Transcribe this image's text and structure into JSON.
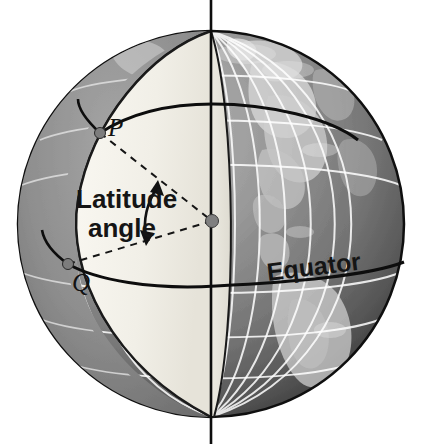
{
  "figure": {
    "labels": {
      "latitude_line1": "Latitude",
      "latitude_line2": "angle",
      "point_p": "P",
      "point_q": "Q",
      "equator": "Equator"
    },
    "colors": {
      "globe_light": "#a9a9a9",
      "globe_mid": "#8c8c8c",
      "globe_dark": "#4f4f4f",
      "cut_face": "#f2f0e9",
      "cut_face_shadow": "#e3e1d8",
      "outline": "#101010",
      "graticule": "#ffffff",
      "center_dot": "#808080",
      "label_text": "#151515"
    },
    "geometry": {
      "sphere_center_x": 211,
      "sphere_center_y": 224,
      "sphere_radius": 193,
      "axis_top_y": 0,
      "axis_bottom_y": 444,
      "point_p_x": 100,
      "point_p_y": 133,
      "point_q_x": 68,
      "point_q_y": 264,
      "center_dot_x": 212,
      "center_dot_y": 221,
      "center_dot_r": 6
    },
    "annotations": {
      "p_dot": "vertex-point-p",
      "q_dot": "vertex-point-q",
      "center_dot": "earth-center-point",
      "angle_arc": "double-headed-angle-arrow",
      "radius_p": "dashed-radius-to-p",
      "radius_q": "dashed-radius-to-q",
      "equator_line": "equator-curve"
    }
  }
}
